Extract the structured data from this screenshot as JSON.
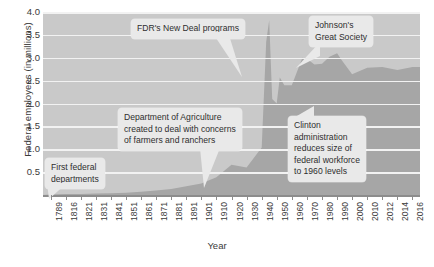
{
  "chart_data": {
    "type": "area",
    "title": "",
    "xlabel": "Year",
    "ylabel": "Federal employees (in millions)",
    "ylim": [
      0,
      4.0
    ],
    "yticks": [
      "4.0",
      "3.5",
      "3.0",
      "2.5",
      "2.0",
      "1.5",
      "1.0",
      "0.5"
    ],
    "ytick_values": [
      4.0,
      3.5,
      3.0,
      2.5,
      2.0,
      1.5,
      1.0,
      0.5
    ],
    "grid": true,
    "legend": "none",
    "categories": [
      "1789",
      "1816",
      "1821",
      "1831",
      "1841",
      "1851",
      "1861",
      "1871",
      "1881",
      "1891",
      "1901",
      "1910",
      "1920",
      "1930",
      "1940",
      "1950",
      "1960",
      "1970",
      "1980",
      "1990",
      "2000",
      "2010",
      "2012",
      "2014",
      "2016"
    ],
    "values": [
      0.02,
      0.05,
      0.07,
      0.11,
      0.18,
      0.26,
      0.37,
      0.51,
      0.1,
      0.16,
      0.24,
      0.39,
      0.66,
      0.6,
      1.04,
      2.0,
      2.4,
      2.98,
      2.87,
      3.1,
      2.64,
      2.78,
      2.8,
      2.73,
      2.8
    ],
    "series": [
      {
        "name": "Federal employees",
        "points": [
          {
            "year": 1789,
            "value": 0.01
          },
          {
            "year": 1816,
            "value": 0.02
          },
          {
            "year": 1821,
            "value": 0.02
          },
          {
            "year": 1831,
            "value": 0.03
          },
          {
            "year": 1841,
            "value": 0.04
          },
          {
            "year": 1851,
            "value": 0.05
          },
          {
            "year": 1861,
            "value": 0.07
          },
          {
            "year": 1871,
            "value": 0.1
          },
          {
            "year": 1881,
            "value": 0.13
          },
          {
            "year": 1891,
            "value": 0.19
          },
          {
            "year": 1901,
            "value": 0.25
          },
          {
            "year": 1910,
            "value": 0.39
          },
          {
            "year": 1920,
            "value": 0.66
          },
          {
            "year": 1930,
            "value": 0.6
          },
          {
            "year": 1940,
            "value": 1.04
          },
          {
            "year": 1943,
            "value": 3.35
          },
          {
            "year": 1945,
            "value": 3.82
          },
          {
            "year": 1947,
            "value": 2.1
          },
          {
            "year": 1950,
            "value": 2.0
          },
          {
            "year": 1952,
            "value": 2.57
          },
          {
            "year": 1955,
            "value": 2.4
          },
          {
            "year": 1960,
            "value": 2.4
          },
          {
            "year": 1967,
            "value": 3.0
          },
          {
            "year": 1970,
            "value": 2.98
          },
          {
            "year": 1975,
            "value": 2.85
          },
          {
            "year": 1980,
            "value": 2.87
          },
          {
            "year": 1985,
            "value": 3.02
          },
          {
            "year": 1990,
            "value": 3.1
          },
          {
            "year": 1993,
            "value": 2.95
          },
          {
            "year": 2000,
            "value": 2.64
          },
          {
            "year": 2010,
            "value": 2.78
          },
          {
            "year": 2012,
            "value": 2.8
          },
          {
            "year": 2014,
            "value": 2.73
          },
          {
            "year": 2016,
            "value": 2.8
          }
        ]
      }
    ],
    "annotations": [
      {
        "id": "first-federal-departments",
        "lines": [
          "First federal",
          "departments"
        ],
        "target_year": 1789
      },
      {
        "id": "department-of-agriculture",
        "lines": [
          "Department of Agriculture",
          "created to deal with concerns",
          "of farmers and ranchers"
        ],
        "target_year": 1862
      },
      {
        "id": "fdr-new-deal",
        "lines": [
          "FDR's New Deal programs"
        ],
        "target_year": 1935
      },
      {
        "id": "johnsons-great-society",
        "lines": [
          "Johnson's",
          "Great Society"
        ],
        "target_year": 1965
      },
      {
        "id": "clinton-administration",
        "lines": [
          "Clinton",
          "administration",
          "reduces size of",
          "federal workforce",
          "to 1960 levels"
        ],
        "target_year": 1995
      }
    ],
    "colors": {
      "plot_background": "#c9c9c9",
      "area_fill": "#a6a6a6",
      "gridline": "#f2f2f2",
      "axis": "#8c8c8c",
      "callout_background": "#e9e9e9",
      "text": "#3a3a3a",
      "page_background": "#ffffff"
    }
  },
  "axes": {
    "ylabel": "Federal employees (in millions)",
    "xlabel": "Year",
    "yticks": [
      "4.0",
      "3.5",
      "3.0",
      "2.5",
      "2.0",
      "1.5",
      "1.0",
      "0.5"
    ],
    "xticks": [
      "1789",
      "1816",
      "1821",
      "1831",
      "1841",
      "1851",
      "1861",
      "1871",
      "1881",
      "1891",
      "1901",
      "1910",
      "1920",
      "1930",
      "1940",
      "1950",
      "1960",
      "1970",
      "1980",
      "1990",
      "2000",
      "2010",
      "2012",
      "2014",
      "2016"
    ]
  },
  "annotations": {
    "first_federal_departments": {
      "line1": "First federal",
      "line2": "departments"
    },
    "department_of_agriculture": {
      "line1": "Department of Agriculture",
      "line2": "created to deal with concerns",
      "line3": "of farmers and ranchers"
    },
    "fdr_new_deal": {
      "line1": "FDR's New Deal programs"
    },
    "johnsons_great_society": {
      "line1": "Johnson's",
      "line2": "Great Society"
    },
    "clinton_administration": {
      "line1": "Clinton",
      "line2": "administration",
      "line3": "reduces size of",
      "line4": "federal workforce",
      "line5": "to 1960 levels"
    }
  },
  "caption": {
    "text": ""
  }
}
